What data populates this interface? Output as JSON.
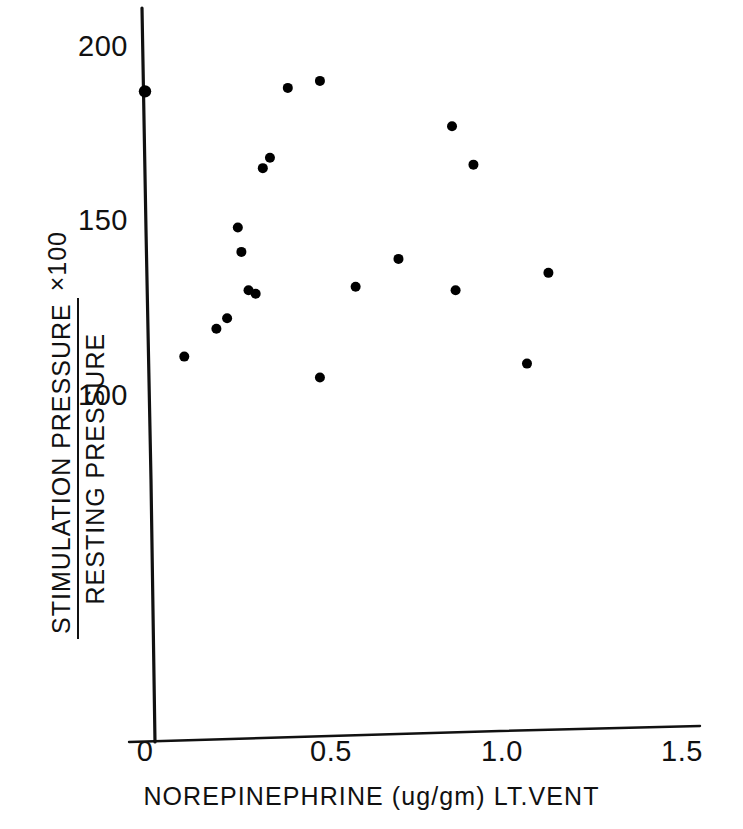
{
  "chart_data": {
    "type": "scatter",
    "title": "",
    "xlabel": "NOREPINEPHRINE  (ug/gm)  LT.VENT",
    "ylabel_numerator": "STIMULATION PRESSURE",
    "ylabel_denominator": "RESTING PRESSURE",
    "ylabel_multiplier": "×100",
    "xlim": [
      0,
      1.62
    ],
    "ylim": [
      60,
      210
    ],
    "xticks": [
      0,
      0.5,
      1.0,
      1.5
    ],
    "xtick_labels": [
      "0",
      "0.5",
      "1.0",
      "1.5"
    ],
    "yticks": [
      100,
      150,
      200
    ],
    "ytick_labels": [
      "100",
      "150",
      "200"
    ],
    "grid": false,
    "legend": "none",
    "marker": "filled-circle",
    "marker_color": "#000000",
    "points": [
      {
        "x": 0.0,
        "y": 187
      },
      {
        "x": 0.11,
        "y": 111
      },
      {
        "x": 0.2,
        "y": 119
      },
      {
        "x": 0.23,
        "y": 122
      },
      {
        "x": 0.26,
        "y": 148
      },
      {
        "x": 0.27,
        "y": 141
      },
      {
        "x": 0.29,
        "y": 130
      },
      {
        "x": 0.31,
        "y": 129
      },
      {
        "x": 0.33,
        "y": 165
      },
      {
        "x": 0.35,
        "y": 168
      },
      {
        "x": 0.4,
        "y": 188
      },
      {
        "x": 0.49,
        "y": 190
      },
      {
        "x": 0.49,
        "y": 105
      },
      {
        "x": 0.59,
        "y": 131
      },
      {
        "x": 0.71,
        "y": 139
      },
      {
        "x": 0.86,
        "y": 177
      },
      {
        "x": 0.87,
        "y": 130
      },
      {
        "x": 0.92,
        "y": 166
      },
      {
        "x": 1.07,
        "y": 109
      },
      {
        "x": 1.13,
        "y": 135
      }
    ]
  },
  "axes": {
    "y_axis_name": "y-axis-line",
    "x_axis_name": "x-axis-line"
  }
}
